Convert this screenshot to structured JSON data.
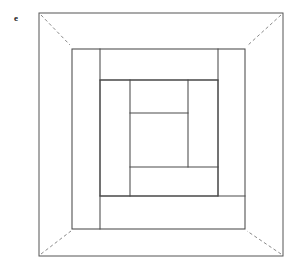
{
  "figure": {
    "panel_label": "e",
    "canvas": {
      "width": 300,
      "height": 272
    },
    "colors": {
      "background": "#ffffff",
      "line": "#4a4a4a",
      "outer_line": "#555555",
      "dash_line": "#8a8a8a",
      "label": "#1a1a1a"
    },
    "outer_frame": {
      "x1": 39,
      "y1": 13,
      "x2": 283,
      "y2": 256
    },
    "second_frame": {
      "x1": 72,
      "y1": 49,
      "x2": 245,
      "y2": 229
    },
    "third_frame": {
      "x1": 100,
      "y1": 80,
      "x2": 218,
      "y2": 196
    },
    "corner_diagonals": [
      {
        "name": "top-left",
        "x1": 41,
        "y1": 15,
        "x2": 70,
        "y2": 45
      },
      {
        "name": "top-right",
        "x1": 281,
        "y1": 15,
        "x2": 247,
        "y2": 46
      },
      {
        "name": "bottom-left",
        "x1": 41,
        "y1": 254,
        "x2": 71,
        "y2": 231
      },
      {
        "name": "bottom-right",
        "x1": 281,
        "y1": 254,
        "x2": 247,
        "y2": 231
      }
    ],
    "inner_lines": [
      {
        "name": "v-100",
        "x1": 100,
        "y1": 49,
        "x2": 100,
        "y2": 229
      },
      {
        "name": "h-80",
        "x1": 100,
        "y1": 80,
        "x2": 218,
        "y2": 80
      },
      {
        "name": "v-218",
        "x1": 218,
        "y1": 49,
        "x2": 218,
        "y2": 196
      },
      {
        "name": "h-196",
        "x1": 100,
        "y1": 196,
        "x2": 245,
        "y2": 196
      },
      {
        "name": "v-130",
        "x1": 130,
        "y1": 80,
        "x2": 130,
        "y2": 196
      },
      {
        "name": "h-113",
        "x1": 130,
        "y1": 113,
        "x2": 188,
        "y2": 113
      },
      {
        "name": "v-188",
        "x1": 188,
        "y1": 80,
        "x2": 188,
        "y2": 167
      },
      {
        "name": "h-167",
        "x1": 130,
        "y1": 167,
        "x2": 218,
        "y2": 167
      }
    ]
  }
}
